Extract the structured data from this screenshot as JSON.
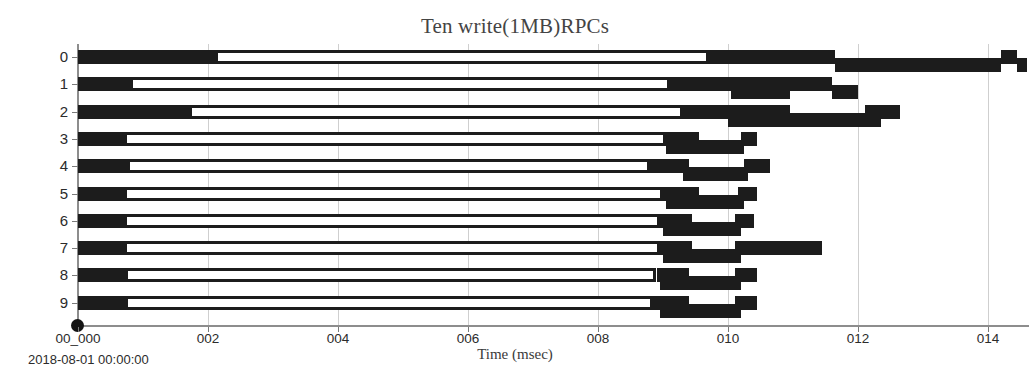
{
  "chart_data": {
    "type": "bar",
    "subtype": "gantt-timeline",
    "title": "Ten write(1MB)RPCs",
    "xlabel": "Time (msec)",
    "ylabel": "RPC Number",
    "start_timestamp": "2018-08-01 00:00:00",
    "xlim": [
      0.0,
      14.6
    ],
    "ylim": [
      -0.5,
      9.5
    ],
    "grid": true,
    "grid_axis": "x",
    "legend": "none",
    "xtick_labels": [
      "00_000",
      "002",
      "004",
      "006",
      "008",
      "010",
      "012",
      "014"
    ],
    "xtick_values": [
      0,
      2,
      4,
      6,
      8,
      10,
      12,
      14
    ],
    "ytick_labels": [
      "0",
      "1",
      "2",
      "3",
      "4",
      "5",
      "6",
      "7",
      "8",
      "9"
    ],
    "categories": [
      "0",
      "1",
      "2",
      "3",
      "4",
      "5",
      "6",
      "7",
      "8",
      "9"
    ],
    "bar_color": "#1c1c1c",
    "hollow_fill": "#ffffff",
    "grid_color": "#cfcfcf",
    "axis_color": "#8d8d8d",
    "rows": [
      {
        "rpc": 0,
        "segments": [
          {
            "kind": "solid",
            "lane": "upper",
            "start": 0.0,
            "end": 2.1
          },
          {
            "kind": "hollow",
            "lane": "upper",
            "start": 2.1,
            "end": 9.7
          },
          {
            "kind": "solid",
            "lane": "upper",
            "start": 9.7,
            "end": 11.65
          },
          {
            "kind": "solid",
            "lane": "lower",
            "start": 11.65,
            "end": 14.2
          },
          {
            "kind": "solid",
            "lane": "upper",
            "start": 14.2,
            "end": 14.45
          },
          {
            "kind": "solid",
            "lane": "lower",
            "start": 14.45,
            "end": 14.6
          }
        ]
      },
      {
        "rpc": 1,
        "segments": [
          {
            "kind": "solid",
            "lane": "upper",
            "start": 0.0,
            "end": 0.8
          },
          {
            "kind": "hollow",
            "lane": "upper",
            "start": 0.8,
            "end": 9.1
          },
          {
            "kind": "solid",
            "lane": "upper",
            "start": 9.1,
            "end": 10.95
          },
          {
            "kind": "solid",
            "lane": "lower",
            "start": 10.05,
            "end": 10.95
          },
          {
            "kind": "solid",
            "lane": "upper",
            "start": 10.95,
            "end": 11.6
          },
          {
            "kind": "solid",
            "lane": "lower",
            "start": 11.6,
            "end": 12.0
          }
        ]
      },
      {
        "rpc": 2,
        "segments": [
          {
            "kind": "solid",
            "lane": "upper",
            "start": 0.0,
            "end": 1.7
          },
          {
            "kind": "hollow",
            "lane": "upper",
            "start": 1.7,
            "end": 9.3
          },
          {
            "kind": "solid",
            "lane": "upper",
            "start": 9.3,
            "end": 10.95
          },
          {
            "kind": "solid",
            "lane": "lower",
            "start": 10.0,
            "end": 10.95
          },
          {
            "kind": "solid",
            "lane": "upper",
            "start": 12.1,
            "end": 12.65
          },
          {
            "kind": "solid",
            "lane": "lower",
            "start": 10.95,
            "end": 12.35
          }
        ]
      },
      {
        "rpc": 3,
        "segments": [
          {
            "kind": "solid",
            "lane": "upper",
            "start": 0.0,
            "end": 0.7
          },
          {
            "kind": "hollow",
            "lane": "upper",
            "start": 0.7,
            "end": 9.05
          },
          {
            "kind": "solid",
            "lane": "upper",
            "start": 9.05,
            "end": 9.55
          },
          {
            "kind": "solid",
            "lane": "lower",
            "start": 9.05,
            "end": 10.25
          },
          {
            "kind": "solid",
            "lane": "upper",
            "start": 10.2,
            "end": 10.45
          }
        ]
      },
      {
        "rpc": 4,
        "segments": [
          {
            "kind": "solid",
            "lane": "upper",
            "start": 0.0,
            "end": 0.75
          },
          {
            "kind": "hollow",
            "lane": "upper",
            "start": 0.75,
            "end": 8.8
          },
          {
            "kind": "solid",
            "lane": "upper",
            "start": 8.8,
            "end": 9.4
          },
          {
            "kind": "solid",
            "lane": "lower",
            "start": 9.3,
            "end": 10.3
          },
          {
            "kind": "solid",
            "lane": "upper",
            "start": 10.25,
            "end": 10.65
          }
        ]
      },
      {
        "rpc": 5,
        "segments": [
          {
            "kind": "solid",
            "lane": "upper",
            "start": 0.0,
            "end": 0.7
          },
          {
            "kind": "hollow",
            "lane": "upper",
            "start": 0.7,
            "end": 9.0
          },
          {
            "kind": "solid",
            "lane": "upper",
            "start": 9.0,
            "end": 9.55
          },
          {
            "kind": "solid",
            "lane": "lower",
            "start": 9.05,
            "end": 10.25
          },
          {
            "kind": "solid",
            "lane": "upper",
            "start": 10.15,
            "end": 10.45
          }
        ]
      },
      {
        "rpc": 6,
        "segments": [
          {
            "kind": "solid",
            "lane": "upper",
            "start": 0.0,
            "end": 0.7
          },
          {
            "kind": "hollow",
            "lane": "upper",
            "start": 0.7,
            "end": 8.95
          },
          {
            "kind": "solid",
            "lane": "upper",
            "start": 8.95,
            "end": 9.45
          },
          {
            "kind": "solid",
            "lane": "lower",
            "start": 9.0,
            "end": 10.2
          },
          {
            "kind": "solid",
            "lane": "upper",
            "start": 10.1,
            "end": 10.4
          }
        ]
      },
      {
        "rpc": 7,
        "segments": [
          {
            "kind": "solid",
            "lane": "upper",
            "start": 0.0,
            "end": 0.7
          },
          {
            "kind": "hollow",
            "lane": "upper",
            "start": 0.7,
            "end": 8.95
          },
          {
            "kind": "solid",
            "lane": "upper",
            "start": 8.95,
            "end": 9.45
          },
          {
            "kind": "solid",
            "lane": "lower",
            "start": 9.0,
            "end": 10.2
          },
          {
            "kind": "solid",
            "lane": "upper",
            "start": 10.1,
            "end": 11.45
          }
        ]
      },
      {
        "rpc": 8,
        "segments": [
          {
            "kind": "solid",
            "lane": "upper",
            "start": 0.0,
            "end": 0.72
          },
          {
            "kind": "hollow",
            "lane": "upper",
            "start": 0.72,
            "end": 8.9
          },
          {
            "kind": "solid",
            "lane": "upper",
            "start": 8.9,
            "end": 9.4
          },
          {
            "kind": "solid",
            "lane": "lower",
            "start": 8.95,
            "end": 10.2
          },
          {
            "kind": "solid",
            "lane": "upper",
            "start": 10.1,
            "end": 10.45
          }
        ]
      },
      {
        "rpc": 9,
        "segments": [
          {
            "kind": "solid",
            "lane": "upper",
            "start": 0.0,
            "end": 0.72
          },
          {
            "kind": "hollow",
            "lane": "upper",
            "start": 0.72,
            "end": 8.85
          },
          {
            "kind": "solid",
            "lane": "upper",
            "start": 8.85,
            "end": 9.4
          },
          {
            "kind": "solid",
            "lane": "lower",
            "start": 8.95,
            "end": 10.2
          },
          {
            "kind": "solid",
            "lane": "upper",
            "start": 10.1,
            "end": 10.45
          }
        ]
      }
    ]
  },
  "geometry": {
    "x_origin_px": 78,
    "x_per_msec": 65.0,
    "row0_center_px": 57,
    "row_pitch_px": 27.3,
    "bar_height_px": 14,
    "lane_offset_px": 8
  }
}
